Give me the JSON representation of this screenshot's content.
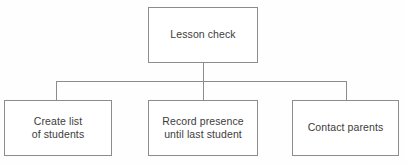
{
  "diagram": {
    "type": "tree-flowchart",
    "colors": {
      "background": "#fefefe",
      "node_fill": "#ffffff",
      "node_border": "#8c8c8c",
      "connector": "#8c8c8c",
      "text": "#3c3c3c"
    },
    "root": {
      "label": "Lesson check"
    },
    "children": [
      {
        "label": "Create list\nof students"
      },
      {
        "label": "Record presence\nuntil last student"
      },
      {
        "label": "Contact parents"
      }
    ]
  }
}
